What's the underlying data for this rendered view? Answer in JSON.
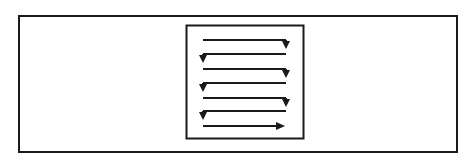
{
  "diagram": {
    "title": "",
    "outer_frame": {
      "x": 18,
      "y": 15,
      "w": 438,
      "h": 136
    },
    "scan_region": {
      "x": 186,
      "y": 25,
      "w": 117,
      "h": 113
    },
    "stroke_color": "#1a1a1a",
    "rows": [
      {
        "y": 40,
        "x1": 203,
        "x2": 286,
        "dir": "right",
        "turn": "down"
      },
      {
        "y": 54,
        "x1": 286,
        "x2": 203,
        "dir": "left",
        "turn": "down"
      },
      {
        "y": 69,
        "x1": 203,
        "x2": 286,
        "dir": "right",
        "turn": "down"
      },
      {
        "y": 83,
        "x1": 286,
        "x2": 203,
        "dir": "left",
        "turn": "down"
      },
      {
        "y": 98,
        "x1": 203,
        "x2": 286,
        "dir": "right",
        "turn": "down"
      },
      {
        "y": 111,
        "x1": 286,
        "x2": 203,
        "dir": "left",
        "turn": "down"
      },
      {
        "y": 126,
        "x1": 203,
        "x2": 285,
        "dir": "right",
        "turn": "end"
      }
    ]
  }
}
